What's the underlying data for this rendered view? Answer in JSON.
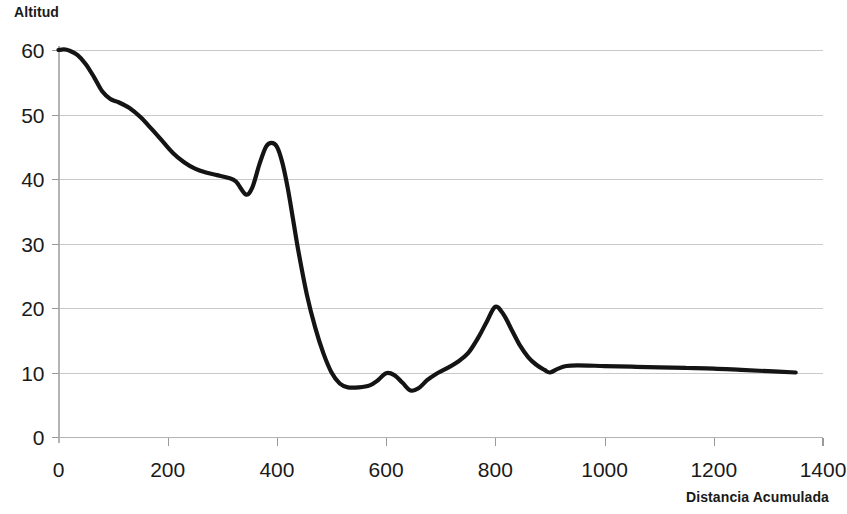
{
  "chart_data": {
    "type": "line",
    "title": "Altitud",
    "subtitle": "",
    "xlabel": "Distancia Acumulada",
    "ylabel": "Altitud",
    "xlim": [
      0,
      1400
    ],
    "ylim": [
      0,
      60
    ],
    "xticks": [
      0,
      200,
      400,
      600,
      800,
      1000,
      1200,
      1400
    ],
    "yticks": [
      0,
      10,
      20,
      30,
      40,
      50,
      60
    ],
    "xtick_labels": [
      "0",
      "200",
      "400",
      "600",
      "800",
      "1000",
      "1200",
      "1400"
    ],
    "ytick_labels": [
      "0",
      "10",
      "20",
      "30",
      "40",
      "50",
      "60"
    ],
    "grid": "horizontal",
    "legend": "none",
    "line_color": "#141414",
    "grid_color": "#c9c9c9",
    "axis_color": "#b4b4b4",
    "background_color": "#ffffff",
    "series": [
      {
        "name": "Altitud",
        "x": [
          0,
          10,
          20,
          35,
          50,
          65,
          80,
          95,
          110,
          130,
          150,
          170,
          190,
          210,
          230,
          250,
          270,
          290,
          310,
          325,
          343,
          355,
          368,
          380,
          390,
          400,
          410,
          420,
          430,
          440,
          455,
          470,
          485,
          500,
          515,
          530,
          550,
          570,
          585,
          600,
          615,
          630,
          645,
          660,
          675,
          690,
          710,
          730,
          750,
          770,
          785,
          800,
          815,
          830,
          845,
          860,
          875,
          890,
          900,
          915,
          930,
          950,
          1000,
          1050,
          1100,
          1150,
          1200,
          1250,
          1300,
          1350
        ],
        "y": [
          60.0,
          60.1,
          59.9,
          59.2,
          57.8,
          55.8,
          53.6,
          52.4,
          51.9,
          51.0,
          49.6,
          47.8,
          45.9,
          44.0,
          42.6,
          41.6,
          41.0,
          40.6,
          40.2,
          39.6,
          37.6,
          38.7,
          42.3,
          45.0,
          45.6,
          45.0,
          42.5,
          38.5,
          33.5,
          28.5,
          22.0,
          17.0,
          13.0,
          10.0,
          8.3,
          7.7,
          7.7,
          8.0,
          8.8,
          9.9,
          9.6,
          8.4,
          7.2,
          7.6,
          8.8,
          9.7,
          10.6,
          11.6,
          13.0,
          15.6,
          18.0,
          20.2,
          19.0,
          16.6,
          14.2,
          12.4,
          11.2,
          10.4,
          10.0,
          10.6,
          11.0,
          11.1,
          11.0,
          10.9,
          10.8,
          10.7,
          10.6,
          10.4,
          10.2,
          10.0
        ]
      }
    ]
  },
  "chart_title": "Altitud",
  "xaxis_title": "Distancia Acumulada"
}
